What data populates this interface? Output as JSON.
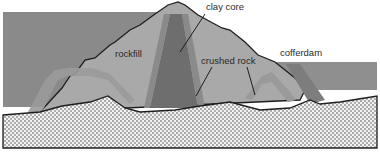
{
  "diagram": {
    "labels": {
      "clay_core": "clay core",
      "rockfill": "rockfill",
      "crushed_rock": "crushed rock",
      "cofferdam": "cofferdam"
    },
    "colors": {
      "background": "#ffffff",
      "reservoir_water": "#8a8a8a",
      "rockfill": "#a9a9a9",
      "filter_zone": "#9c9c9c",
      "clay_core": "#6e6e6e",
      "cofferdam": "#7d7d7d",
      "bedrock_dots": "#3a3a3a",
      "bedrock_bg": "#f2f2f2",
      "outline": "#1e1e1e"
    }
  }
}
